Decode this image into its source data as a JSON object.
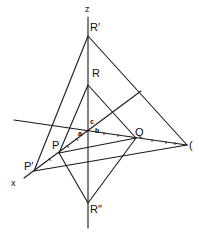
{
  "figure": {
    "type": "geometric-projection-diagram",
    "axes": {
      "z_label": "z",
      "x_label": "x"
    },
    "points": {
      "R_prime": "R′",
      "R": "R",
      "R_double_prime": "R″",
      "P": "P",
      "P_prime": "P′",
      "Q": "Q",
      "right_point": "("
    },
    "intercept_labels": {
      "a": "a",
      "b": "b",
      "c": "c"
    },
    "colors": {
      "line": "#1a1a1a",
      "background": "#ffffff"
    }
  }
}
